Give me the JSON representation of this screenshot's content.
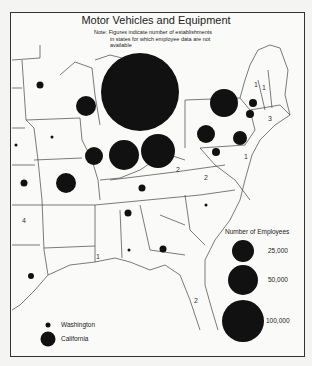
{
  "title": "Motor Vehicles and Equipment",
  "note": {
    "prefix": "Note:",
    "line1": "Figures indicate number of establishments",
    "line2": "in states for which employee data are not",
    "line3": "available"
  },
  "legend": {
    "title": "Number of Employees",
    "entries": [
      {
        "label": "25,000",
        "value": 25000
      },
      {
        "label": "50,000",
        "value": 50000
      },
      {
        "label": "100,000",
        "value": 100000
      }
    ]
  },
  "key": {
    "small_label": "Washington",
    "large_label": "California"
  },
  "establishment_counts": [
    {
      "label": "1",
      "region": "Vermont"
    },
    {
      "label": "1",
      "region": "New Hampshire"
    },
    {
      "label": "3",
      "region": "Rhode Island"
    },
    {
      "label": "1",
      "region": "Delaware"
    },
    {
      "label": "2",
      "region": "West Virginia"
    },
    {
      "label": "2",
      "region": "Virginia"
    },
    {
      "label": "4",
      "region": "Oklahoma"
    },
    {
      "label": "1",
      "region": "Mississippi"
    },
    {
      "label": "2",
      "region": "Florida"
    }
  ],
  "circles": [
    {
      "region": "Michigan",
      "size": "very large"
    },
    {
      "region": "Ohio",
      "size": "large"
    },
    {
      "region": "Indiana",
      "size": "large"
    },
    {
      "region": "New York",
      "size": "large"
    },
    {
      "region": "Wisconsin",
      "size": "medium"
    },
    {
      "region": "Illinois",
      "size": "medium"
    },
    {
      "region": "Missouri",
      "size": "medium"
    },
    {
      "region": "Pennsylvania",
      "size": "medium"
    },
    {
      "region": "New Jersey",
      "size": "medium"
    },
    {
      "region": "Massachusetts",
      "size": "small"
    },
    {
      "region": "Connecticut",
      "size": "small"
    },
    {
      "region": "Maryland",
      "size": "small"
    },
    {
      "region": "Kentucky",
      "size": "small"
    },
    {
      "region": "Tennessee",
      "size": "small"
    },
    {
      "region": "Georgia",
      "size": "small"
    },
    {
      "region": "Minnesota",
      "size": "small"
    },
    {
      "region": "Kansas",
      "size": "small"
    },
    {
      "region": "Texas",
      "size": "small"
    },
    {
      "region": "Iowa",
      "size": "tiny"
    },
    {
      "region": "Nebraska",
      "size": "tiny"
    },
    {
      "region": "North Carolina",
      "size": "tiny"
    },
    {
      "region": "Alabama",
      "size": "tiny"
    }
  ]
}
